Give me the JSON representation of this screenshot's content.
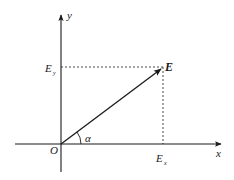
{
  "diagram": {
    "type": "vector-decomposition",
    "axes": {
      "x_label": "x",
      "y_label": "y",
      "origin_label": "O"
    },
    "vector": {
      "label": "E",
      "x_component_label": "E",
      "x_component_sub": "x",
      "y_component_label": "E",
      "y_component_sub": "y",
      "angle_label": "α"
    },
    "colors": {
      "stroke": "#1a1a1a",
      "background": "#ffffff"
    }
  }
}
